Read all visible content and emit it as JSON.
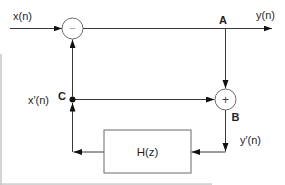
{
  "diagram": {
    "signals": {
      "input": "x(n)",
      "output": "y(n)",
      "feedback_signal": "x′(n)",
      "filter_input": "y′(n)"
    },
    "nodes": {
      "a": "A",
      "b": "B",
      "c": "C"
    },
    "blocks": {
      "filter": "H(z)",
      "subtractor_sign": "−",
      "adder_sign": "+"
    },
    "colors": {
      "wire": "#3a3a3a",
      "shape_stroke": "#6b6b6b",
      "arrowhead": "#111111",
      "text": "#1f1f1f",
      "subtractor_sign": "#9a9a9a",
      "background": "#ffffff"
    }
  }
}
